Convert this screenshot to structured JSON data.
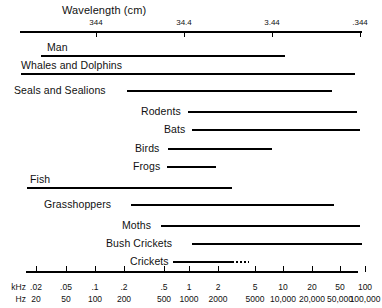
{
  "chart_data": {
    "type": "bar",
    "title": "Wavelength (cm)",
    "orientation": "horizontal-range",
    "xlabel_top": "Wavelength (cm)",
    "xlabel_bottom_units": [
      "kHz",
      "Hz"
    ],
    "x_scale": "log",
    "top_axis": {
      "label": "Wavelength (cm)",
      "ticks": [
        {
          "label": "344",
          "x": 96
        },
        {
          "label": "34.4",
          "x": 184
        },
        {
          "label": "3.44",
          "x": 272
        },
        {
          "label": ".344",
          "x": 360
        }
      ],
      "line_start": 20,
      "line_end": 362
    },
    "bottom_axis": {
      "line_start": 26,
      "line_end": 358,
      "khz_label": "kHz",
      "hz_label": "Hz",
      "ticks": [
        {
          "khz": ".02",
          "hz": "20",
          "x": 36
        },
        {
          "khz": ".05",
          "hz": "50",
          "x": 66
        },
        {
          "khz": ".1",
          "hz": "100",
          "x": 95
        },
        {
          "khz": ".2",
          "hz": "200",
          "x": 124
        },
        {
          "khz": ".5",
          "hz": "500",
          "x": 164
        },
        {
          "khz": "1",
          "hz": "1000",
          "x": 189
        },
        {
          "khz": "2",
          "hz": "2000",
          "x": 218
        },
        {
          "khz": "5",
          "hz": "5000",
          "x": 255
        },
        {
          "khz": "10",
          "hz": "10,000",
          "x": 283
        },
        {
          "khz": "20",
          "hz": "20,000",
          "x": 312
        },
        {
          "khz": "50",
          "hz": "50,000",
          "x": 340
        },
        {
          "khz": "100",
          "hz": "100,000",
          "x": 365
        }
      ]
    },
    "rows": [
      {
        "name": "Man",
        "label_x": 47,
        "label_y": 41,
        "bar_start": 41,
        "bar_end": 285,
        "bar_y": 55,
        "label_above": true,
        "dotted_end": null
      },
      {
        "name": "Whales and Dolphins",
        "label_x": 21,
        "label_y": 59,
        "bar_start": 21,
        "bar_end": 355,
        "bar_y": 73,
        "label_above": true,
        "dotted_end": null
      },
      {
        "name": "Seals and Sealions",
        "label_x": 14,
        "label_y": 84,
        "bar_start": 127,
        "bar_end": 332,
        "bar_y": 90,
        "label_above": false,
        "dotted_end": null
      },
      {
        "name": "Rodents",
        "label_x": 141,
        "label_y": 105,
        "bar_start": 188,
        "bar_end": 357,
        "bar_y": 111,
        "label_above": false,
        "dotted_end": null
      },
      {
        "name": "Bats",
        "label_x": 164,
        "label_y": 123,
        "bar_start": 192,
        "bar_end": 360,
        "bar_y": 129,
        "label_above": false,
        "dotted_end": null
      },
      {
        "name": "Birds",
        "label_x": 135,
        "label_y": 142,
        "bar_start": 168,
        "bar_end": 272,
        "bar_y": 148,
        "label_above": false,
        "dotted_end": null
      },
      {
        "name": "Frogs",
        "label_x": 133,
        "label_y": 160,
        "bar_start": 167,
        "bar_end": 216,
        "bar_y": 166,
        "label_above": false,
        "dotted_end": null
      },
      {
        "name": "Fish",
        "label_x": 30,
        "label_y": 173,
        "bar_start": 27,
        "bar_end": 232,
        "bar_y": 187,
        "label_above": true,
        "dotted_end": null
      },
      {
        "name": "Grasshoppers",
        "label_x": 44,
        "label_y": 198,
        "bar_start": 131,
        "bar_end": 334,
        "bar_y": 204,
        "label_above": false,
        "dotted_end": null
      },
      {
        "name": "Moths",
        "label_x": 122,
        "label_y": 219,
        "bar_start": 161,
        "bar_end": 360,
        "bar_y": 225,
        "label_above": false,
        "dotted_end": null
      },
      {
        "name": "Bush Crickets",
        "label_x": 106,
        "label_y": 237,
        "bar_start": 192,
        "bar_end": 362,
        "bar_y": 243,
        "label_above": false,
        "dotted_end": null
      },
      {
        "name": "Crickets",
        "label_x": 130,
        "label_y": 255,
        "bar_start": 173,
        "bar_end": 232,
        "bar_y": 261,
        "label_above": false,
        "dotted_end": 249
      }
    ]
  }
}
